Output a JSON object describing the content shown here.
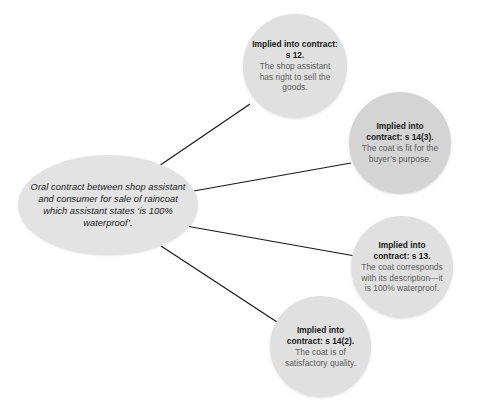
{
  "diagram": {
    "source": {
      "name": "oral-contract-source",
      "text": "Oral contract between shop assistant and consumer for sale of raincoat which assistant states ‘is 100% waterproof’."
    },
    "terms": [
      {
        "id": "s12",
        "title": "Implied into contract: s 12.",
        "body": "The shop assistant has right to sell the goods.",
        "shade": "#e0e0e0"
      },
      {
        "id": "s14-3",
        "title": "Implied into contract: s 14(3).",
        "body": "The coat is fit for the buyer’s purpose.",
        "shade": "#d4d4d4"
      },
      {
        "id": "s13",
        "title": "Implied into contract: s 13.",
        "body": "The coat corresponds with its description—it is 100% waterproof.",
        "shade": "#e0e0e0"
      },
      {
        "id": "s14-2",
        "title": "Implied into contract: s 14(2).",
        "body": "The coat is of satisfactory quality.",
        "shade": "#e0e0e0"
      }
    ],
    "connector_color": "#1a1a1a",
    "background_color": "#ffffff"
  }
}
